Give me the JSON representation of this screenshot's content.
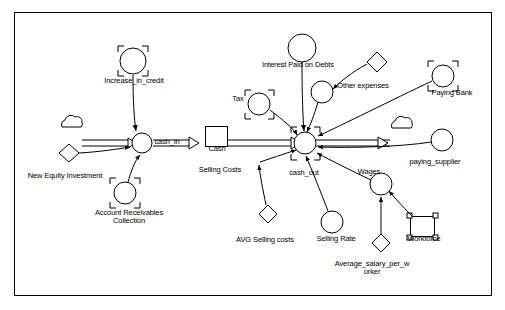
{
  "diagram": {
    "type": "system-dynamics-stock-and-flow",
    "border": {
      "x": 14,
      "y": 12,
      "width": 478,
      "height": 284,
      "color": "#000000"
    },
    "stocks": [
      {
        "name": "Cash",
        "label": "Cash",
        "x": 205,
        "y": 126,
        "w": 22,
        "h": 20,
        "label_x": 203,
        "label_y": 148
      },
      {
        "name": "Workforce",
        "label": "Workforce",
        "x": 410,
        "y": 216,
        "w": 24,
        "h": 20,
        "label_x": 401,
        "label_y": 238
      }
    ],
    "flows": [
      {
        "name": "cash_in",
        "label": "cash_in",
        "cx": 142,
        "cy": 147,
        "r": 10,
        "label_x": 146,
        "label_y": 141
      },
      {
        "name": "cash_out",
        "label": "cash_out",
        "cx": 305,
        "cy": 149,
        "r": 11,
        "label_x": 283,
        "label_y": 172
      }
    ],
    "converters": [
      {
        "name": "Increase_in_credit",
        "label": "Increase_in_credit",
        "cx": 133,
        "cy": 60,
        "r": 13,
        "label_x": 96,
        "label_y": 80,
        "bracket": true
      },
      {
        "name": "Interest_Paid_on_Debts",
        "label": "Interest Paid on Debts",
        "cx": 302,
        "cy": 52,
        "r": 13,
        "label_x": 254,
        "label_y": 66,
        "bracket": false
      },
      {
        "name": "Other_expenses",
        "label": "Other expenses",
        "cx": 324,
        "cy": 94,
        "r": 12,
        "label_x": 331,
        "label_y": 85,
        "bracket": false
      },
      {
        "name": "Tax",
        "label": "Tax",
        "cx": 258,
        "cy": 103,
        "r": 12,
        "label_x": 231,
        "label_y": 99,
        "bracket": false
      },
      {
        "name": "Paying_Bank",
        "label": "Paying Bank",
        "cx": 441,
        "cy": 77,
        "r": 12,
        "label_x": 426,
        "label_y": 92,
        "bracket": true
      },
      {
        "name": "paying_supplier",
        "label": "paying_supplier",
        "cx": 441,
        "cy": 140,
        "r": 12,
        "label_x": 404,
        "label_y": 161,
        "bracket": false
      },
      {
        "name": "Account_Receivables_Collection",
        "label": "Account Receivables\nCollection",
        "cx": 125,
        "cy": 194,
        "r": 12,
        "label_x": 92,
        "label_y": 213,
        "bracket": true
      },
      {
        "name": "Selling_Costs",
        "label": "Selling Costs",
        "cx": 258,
        "cy": 151,
        "r": 0,
        "label_x": 193,
        "label_y": 170,
        "bracket": false
      },
      {
        "name": "Selling_Rate",
        "label": "Selling Rate",
        "cx": 331,
        "cy": 223,
        "r": 12,
        "label_x": 313,
        "label_y": 239,
        "bracket": false
      },
      {
        "name": "Wages",
        "label": "Wages",
        "cx": 381,
        "cy": 186,
        "r": 12,
        "label_x": 353,
        "label_y": 171,
        "bracket": false
      }
    ],
    "diamonds": [
      {
        "name": "New_Equity_Investment",
        "label": "New Equity Investment",
        "cx": 69,
        "cy": 153,
        "label_x": 20,
        "label_y": 176
      },
      {
        "name": "Other_expenses_diamond",
        "label": "",
        "cx": 376,
        "cy": 62,
        "label_x": 0,
        "label_y": 0
      },
      {
        "name": "AVG_Selling_costs",
        "label": "AVG Selling costs",
        "cx": 268,
        "cy": 214,
        "label_x": 232,
        "label_y": 240
      },
      {
        "name": "Average_salary_per_worker",
        "label": "Average_salary_per_w\norker",
        "cx": 381,
        "cy": 243,
        "label_x": 330,
        "label_y": 264
      }
    ],
    "clouds": [
      {
        "name": "cloud-left",
        "cx": 72,
        "cy": 125
      },
      {
        "name": "cloud-right",
        "cx": 402,
        "cy": 126
      }
    ],
    "labels": [
      {
        "name": "increase-in-credit-label",
        "text": "Increase_in_credit",
        "x": 96,
        "y": 80,
        "w": 74
      },
      {
        "name": "interest-paid-on-debts-label",
        "text": "Interest Paid on Debts",
        "x": 252,
        "y": 63,
        "w": 90
      },
      {
        "name": "other-expenses-label",
        "text": "Other expenses",
        "x": 330,
        "y": 84,
        "w": 66
      },
      {
        "name": "tax-label",
        "text": "Tax",
        "x": 228,
        "y": 97,
        "w": 20
      },
      {
        "name": "paying-bank-label",
        "text": "Paying Bank",
        "x": 424,
        "y": 91,
        "w": 56
      },
      {
        "name": "cash-in-label",
        "text": "cash_in",
        "x": 148,
        "y": 140,
        "w": 36
      },
      {
        "name": "cash-label",
        "text": "Cash",
        "x": 204,
        "y": 146,
        "w": 26
      },
      {
        "name": "paying-supplier-label",
        "text": "paying_supplier",
        "x": 402,
        "y": 160,
        "w": 66
      },
      {
        "name": "new-equity-investment-label",
        "text": "New Equity Investment",
        "x": 16,
        "y": 174,
        "w": 96
      },
      {
        "name": "selling-costs-label",
        "text": "Selling Costs",
        "x": 191,
        "y": 168,
        "w": 58
      },
      {
        "name": "cash-out-label",
        "text": "cash_out",
        "x": 283,
        "y": 171,
        "w": 44
      },
      {
        "name": "wages-label",
        "text": "Wages",
        "x": 352,
        "y": 170,
        "w": 34
      },
      {
        "name": "account-receivables-collection-label",
        "text": "Account Receivables\nCollection",
        "x": 88,
        "y": 211,
        "w": 82
      },
      {
        "name": "workforce-label",
        "text": "Workforce",
        "x": 400,
        "y": 237,
        "w": 48
      },
      {
        "name": "avg-selling-costs-label",
        "text": "AVG Selling costs",
        "x": 228,
        "y": 238,
        "w": 74
      },
      {
        "name": "selling-rate-label",
        "text": "Selling Rate",
        "x": 310,
        "y": 237,
        "w": 52
      },
      {
        "name": "average-salary-per-worker-label",
        "text": "Average_salary_per_w\norker",
        "x": 326,
        "y": 262,
        "w": 90
      }
    ]
  }
}
